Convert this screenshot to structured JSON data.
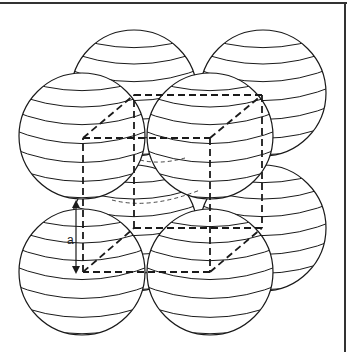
{
  "diagram": {
    "type": "simple-cubic-unit-cell",
    "edge_label": "a",
    "colors": {
      "stroke": "#1a1a1a",
      "background": "#ffffff",
      "frame": "#333333"
    },
    "spheres": [
      {
        "id": "back-top-left",
        "cx": 134,
        "cy": 93,
        "r": 63
      },
      {
        "id": "back-top-right",
        "cx": 263,
        "cy": 93,
        "r": 63
      },
      {
        "id": "back-bottom-left",
        "cx": 134,
        "cy": 228,
        "r": 63
      },
      {
        "id": "back-bottom-right",
        "cx": 263,
        "cy": 228,
        "r": 63
      },
      {
        "id": "front-top-left",
        "cx": 82,
        "cy": 136,
        "r": 63
      },
      {
        "id": "front-top-right",
        "cx": 210,
        "cy": 136,
        "r": 63
      },
      {
        "id": "front-bottom-left",
        "cx": 82,
        "cy": 272,
        "r": 63
      },
      {
        "id": "front-bottom-right",
        "cx": 210,
        "cy": 272,
        "r": 63
      }
    ],
    "cube": {
      "front": {
        "tl": [
          83,
          138
        ],
        "tr": [
          210,
          138
        ],
        "bl": [
          83,
          272
        ],
        "br": [
          210,
          272
        ]
      },
      "back": {
        "tl": [
          134,
          95
        ],
        "tr": [
          262,
          95
        ],
        "bl": [
          134,
          228
        ],
        "br": [
          262,
          228
        ]
      }
    }
  }
}
